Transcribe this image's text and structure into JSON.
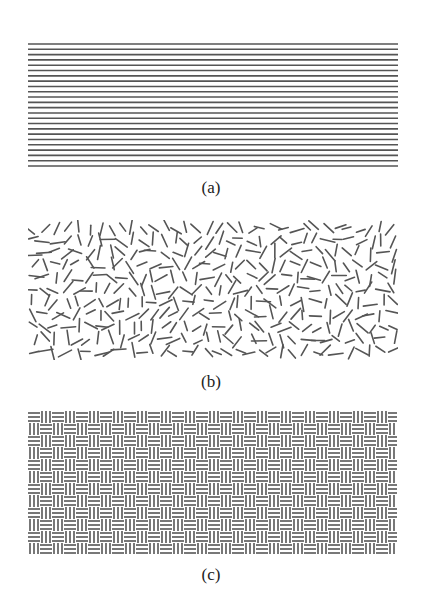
{
  "figure": {
    "panels": [
      {
        "id": "a",
        "label": "(a)",
        "description": "parallel horizontal lines",
        "pattern": "horizontal-lines",
        "line_count": 24,
        "line_color": "#555555"
      },
      {
        "id": "b",
        "label": "(b)",
        "description": "randomly oriented short line segments",
        "pattern": "random-segments",
        "line_color": "#555555"
      },
      {
        "id": "c",
        "label": "(c)",
        "description": "basketweave texture of alternating horizontal and vertical line blocks",
        "pattern": "basketweave",
        "line_color": "#555555"
      }
    ]
  }
}
